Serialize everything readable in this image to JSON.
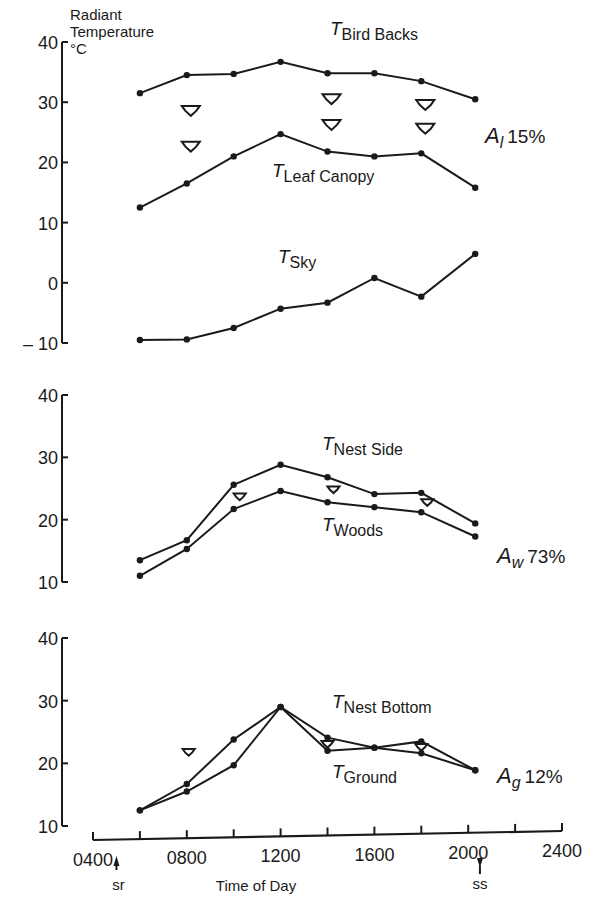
{
  "chart_data": [
    {
      "type": "line",
      "panel": "top",
      "ylabel": "Radiant Temperature °C",
      "ylabel_lines": [
        "Radiant",
        "Temperature",
        "°C"
      ],
      "ylim": [
        -10,
        40
      ],
      "yticks": [
        40,
        30,
        20,
        10,
        0,
        -10
      ],
      "ytick_labels": [
        "40",
        "30",
        "20",
        "10",
        "0",
        "– 10"
      ],
      "annotation": {
        "symbol": "A",
        "subscript": "l",
        "value": "15%"
      },
      "series": [
        {
          "name": "T Bird Backs",
          "label_main": "T",
          "label_sub": "Bird Backs",
          "x": [
            600,
            800,
            1000,
            1200,
            1400,
            1600,
            1800,
            2030
          ],
          "values": [
            31.5,
            34.5,
            34.7,
            36.7,
            34.8,
            34.8,
            33.5,
            30.5
          ]
        },
        {
          "name": "T Leaf Canopy",
          "label_main": "T",
          "label_sub": "Leaf Canopy",
          "x": [
            600,
            800,
            1000,
            1200,
            1400,
            1600,
            1800,
            2030
          ],
          "values": [
            12.5,
            16.5,
            21.0,
            24.7,
            21.8,
            21.0,
            21.5,
            15.8
          ]
        },
        {
          "name": "T Sky",
          "label_main": "T",
          "label_sub": "Sky",
          "x": [
            600,
            800,
            1000,
            1200,
            1400,
            1600,
            1800,
            2030
          ],
          "values": [
            -9.5,
            -9.4,
            -7.5,
            -4.3,
            -3.3,
            0.8,
            -2.3,
            4.8
          ]
        }
      ],
      "arrows_between": [
        "T Bird Backs",
        "T Leaf Canopy"
      ]
    },
    {
      "type": "line",
      "panel": "middle",
      "ylim": [
        10,
        40
      ],
      "yticks": [
        40,
        30,
        20,
        10
      ],
      "ytick_labels": [
        "40",
        "30",
        "20",
        "10"
      ],
      "annotation": {
        "symbol": "A",
        "subscript": "w",
        "value": "73%"
      },
      "series": [
        {
          "name": "T Nest Side",
          "label_main": "T",
          "label_sub": "Nest Side",
          "x": [
            600,
            800,
            1000,
            1200,
            1400,
            1600,
            1800,
            2030
          ],
          "values": [
            13.5,
            16.7,
            25.6,
            28.8,
            26.8,
            24.1,
            24.3,
            19.4
          ]
        },
        {
          "name": "T Woods",
          "label_main": "T",
          "label_sub": "Woods",
          "x": [
            600,
            800,
            1000,
            1200,
            1400,
            1600,
            1800,
            2030
          ],
          "values": [
            11.0,
            15.3,
            21.7,
            24.6,
            22.8,
            22.0,
            21.2,
            17.3
          ]
        }
      ],
      "arrows_between": [
        "T Nest Side",
        "T Woods"
      ]
    },
    {
      "type": "line",
      "panel": "bottom",
      "ylim": [
        10,
        40
      ],
      "yticks": [
        40,
        30,
        20,
        10
      ],
      "ytick_labels": [
        "40",
        "30",
        "20",
        "10"
      ],
      "annotation": {
        "symbol": "A",
        "subscript": "g",
        "value": "12%"
      },
      "series": [
        {
          "name": "T Nest Bottom",
          "label_main": "T",
          "label_sub": "Nest Bottom",
          "x": [
            600,
            800,
            1000,
            1200,
            1400,
            1600,
            1800,
            2030
          ],
          "values": [
            12.5,
            16.7,
            23.8,
            29.0,
            24.1,
            22.5,
            23.5,
            18.9
          ]
        },
        {
          "name": "T Ground",
          "label_main": "T",
          "label_sub": "Ground",
          "x": [
            600,
            800,
            1000,
            1200,
            1400,
            1600,
            1800,
            2030
          ],
          "values": [
            12.5,
            15.5,
            19.7,
            29.0,
            22.0,
            22.5,
            21.6,
            18.9
          ]
        }
      ],
      "arrows_between": [
        "T Nest Bottom",
        "T Ground"
      ]
    }
  ],
  "x_axis": {
    "title": "Time of Day",
    "range": [
      400,
      2400
    ],
    "tick_labels": [
      "0400",
      "0800",
      "1200",
      "1600",
      "2000",
      "2400"
    ],
    "minor_ticks_every": 200,
    "markers": [
      {
        "label": "sr",
        "meaning": "sunrise",
        "x": 500,
        "direction": "up"
      },
      {
        "label": "ss",
        "meaning": "sunset",
        "x": 2050,
        "direction": "down"
      }
    ]
  }
}
